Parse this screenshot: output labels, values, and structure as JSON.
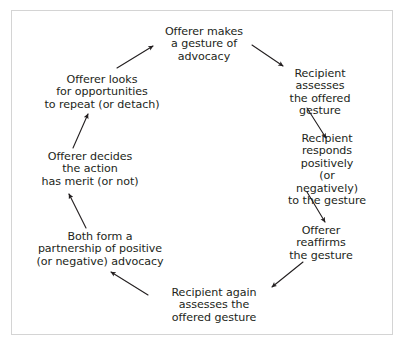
{
  "diagram": {
    "type": "cycle",
    "direction": "clockwise",
    "background_color": "#ffffff",
    "text_color": "#231f20",
    "frame": {
      "border_color": "#d4d4d4",
      "border_width_px": 1
    },
    "arrow": {
      "color": "#231f20",
      "stroke_width_px": 1.1,
      "head": "solid-triangle"
    },
    "nodes": [
      {
        "id": "offerer-makes-gesture",
        "label": "Offerer makes\na gesture of\nadvocacy",
        "position": "top"
      },
      {
        "id": "recipient-assesses-gesture",
        "label": "Recipient assesses\nthe offered gesture",
        "position": "upper-right"
      },
      {
        "id": "recipient-responds",
        "label": "Recipient responds\npositively\n(or negatively)\nto the gesture",
        "position": "right"
      },
      {
        "id": "offerer-reaffirms-gesture",
        "label": "Offerer reaffirms\nthe gesture",
        "position": "lower-right"
      },
      {
        "id": "recipient-again-assesses",
        "label": "Recipient again\nassesses the\noffered gesture",
        "position": "bottom"
      },
      {
        "id": "both-form-partnership",
        "label": "Both form a\npartnership of positive\n(or negative) advocacy",
        "position": "lower-left"
      },
      {
        "id": "offerer-decides-merit",
        "label": "Offerer decides\nthe action\nhas merit (or not)",
        "position": "left"
      },
      {
        "id": "offerer-looks-opportunities",
        "label": "Offerer looks\nfor opportunities\nto repeat (or detach)",
        "position": "upper-left"
      }
    ],
    "edges": [
      {
        "id": "edge-0",
        "from": "offerer-makes-gesture",
        "to": "recipient-assesses-gesture"
      },
      {
        "id": "edge-1",
        "from": "recipient-assesses-gesture",
        "to": "recipient-responds"
      },
      {
        "id": "edge-2",
        "from": "recipient-responds",
        "to": "offerer-reaffirms-gesture"
      },
      {
        "id": "edge-3",
        "from": "offerer-reaffirms-gesture",
        "to": "recipient-again-assesses"
      },
      {
        "id": "edge-4",
        "from": "recipient-again-assesses",
        "to": "both-form-partnership"
      },
      {
        "id": "edge-5",
        "from": "both-form-partnership",
        "to": "offerer-decides-merit"
      },
      {
        "id": "edge-6",
        "from": "offerer-decides-merit",
        "to": "offerer-looks-opportunities"
      },
      {
        "id": "edge-7",
        "from": "offerer-looks-opportunities",
        "to": "offerer-makes-gesture"
      }
    ]
  }
}
